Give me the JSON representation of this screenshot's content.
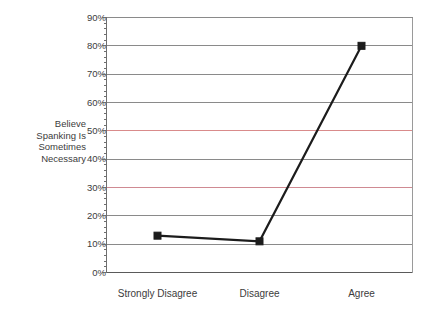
{
  "chart_data": {
    "type": "line",
    "title": "",
    "xlabel": "",
    "ylabel": "Believe Spanking Is Sometimes Necessary",
    "ylabel_lines": [
      "Believe",
      "Spanking Is",
      "Sometimes",
      "Necessary"
    ],
    "categories": [
      "Strongly Disagree",
      "Disagree",
      "Agree"
    ],
    "values": [
      13,
      11,
      80
    ],
    "series": [
      {
        "name": "Believe Spanking Is Sometimes Necessary",
        "values": [
          13,
          11,
          80
        ]
      }
    ],
    "ylim": [
      0,
      90
    ],
    "ytick_labels": [
      "0%",
      "10%",
      "20%",
      "30%",
      "40%",
      "50%",
      "60%",
      "70%",
      "80%",
      "90%"
    ],
    "ytick_values": [
      0,
      10,
      20,
      30,
      40,
      50,
      60,
      70,
      80,
      90
    ],
    "minor_ticks_between": 4,
    "grid": true,
    "legend": "none",
    "marker": "square",
    "colors": {
      "line": "#1c1c1c",
      "marker": "#1c1c1c",
      "grid": "#8a8a8a",
      "grid_accent_50": "#d98b8b",
      "grid_accent_30": "#cf8a92",
      "axis": "#6e6e6e",
      "text": "#3c3c3c",
      "background": "#ffffff"
    },
    "highlighted_gridlines": [
      {
        "value": 50,
        "color": "#d98b8b"
      },
      {
        "value": 30,
        "color": "#cf8a92"
      }
    ]
  }
}
